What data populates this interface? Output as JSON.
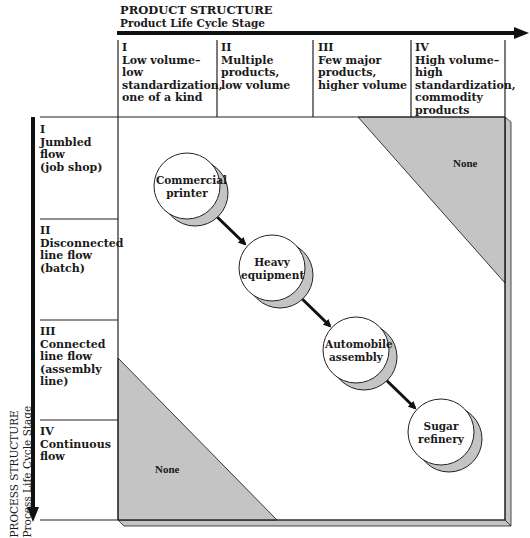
{
  "header": {
    "title": "PRODUCT STRUCTURE",
    "subtitle": "Product Life Cycle Stage"
  },
  "columns": [
    {
      "roman": "I",
      "lines": [
        "Low volume–low",
        "standardization,",
        "one of a kind"
      ]
    },
    {
      "roman": "II",
      "lines": [
        "Multiple",
        "products,",
        "low volume"
      ]
    },
    {
      "roman": "III",
      "lines": [
        "Few major",
        "products,",
        "higher volume"
      ]
    },
    {
      "roman": "IV",
      "lines": [
        "High volume–high",
        "standardization,",
        "commodity",
        "products"
      ]
    }
  ],
  "rows": [
    {
      "roman": "I",
      "lines": [
        "Jumbled flow",
        "(job shop)"
      ]
    },
    {
      "roman": "II",
      "lines": [
        "Disconnected",
        "line flow",
        "(batch)"
      ]
    },
    {
      "roman": "III",
      "lines": [
        "Connected",
        "line flow",
        "(assembly line)"
      ]
    },
    {
      "roman": "IV",
      "lines": [
        "Continuous",
        "flow"
      ]
    }
  ],
  "side_axis": {
    "title": "PROCESS STRUCTURE",
    "subtitle": "Process Life Cycle Stage"
  },
  "nodes": [
    {
      "lines": [
        "Commercial",
        "printer"
      ]
    },
    {
      "lines": [
        "Heavy",
        "equipment"
      ]
    },
    {
      "lines": [
        "Automobile",
        "assembly"
      ]
    },
    {
      "lines": [
        "Sugar",
        "refinery"
      ]
    }
  ],
  "regions": {
    "top_right": "None",
    "bottom_left": "None"
  },
  "colors": {
    "shade": "#c4c4c4",
    "line": "#1a1a1a",
    "background": "#ffffff"
  }
}
